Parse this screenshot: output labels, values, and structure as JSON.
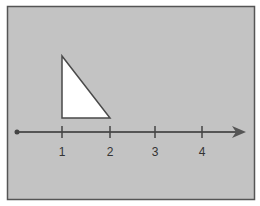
{
  "diagram": {
    "background_color": "#c3c3c3",
    "border_color": "#555555",
    "number_line": {
      "ticks": [
        {
          "value": 1,
          "label": "1"
        },
        {
          "value": 2,
          "label": "2"
        },
        {
          "value": 3,
          "label": "3"
        },
        {
          "value": 4,
          "label": "4"
        }
      ],
      "origin_marker": "dot",
      "end_marker": "arrow"
    },
    "shape": {
      "type": "right-triangle",
      "fill": "#ffffff",
      "base_from": 1,
      "base_to": 2
    }
  }
}
